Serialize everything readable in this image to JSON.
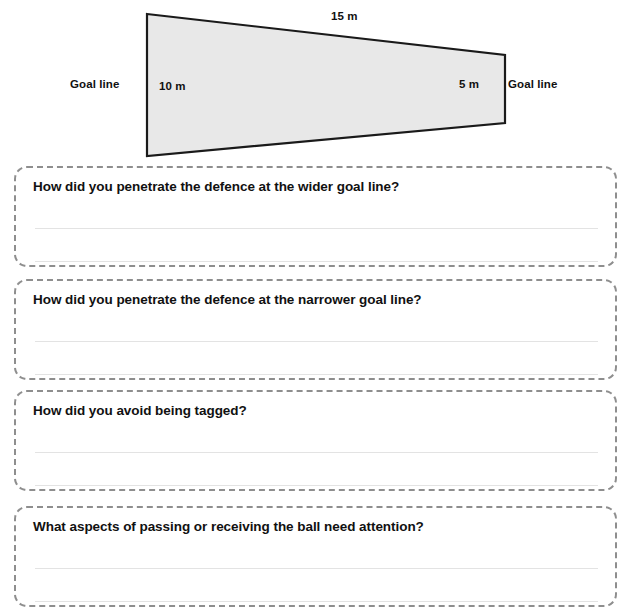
{
  "page": {
    "background_color": "#ffffff",
    "cut_off_text_top": ""
  },
  "diagram": {
    "name": "tapered-pitch-diagram",
    "shape": "trapezoid",
    "fill_color": "#e8e8e8",
    "stroke_color": "#1a1a1a",
    "labels": {
      "goal_line_left": "Goal line",
      "goal_line_right": "Goal line",
      "width_left": "10 m",
      "width_right": "5 m",
      "length_top": "15 m"
    }
  },
  "questions": [
    {
      "id": "q1",
      "text": "How did you penetrate the defence at the wider goal line?",
      "answer_lines": 2,
      "answer_values": [
        "",
        ""
      ]
    },
    {
      "id": "q2",
      "text": "How did you penetrate the defence at the narrower goal line?",
      "answer_lines": 2,
      "answer_values": [
        "",
        ""
      ]
    },
    {
      "id": "q3",
      "text": "How did you avoid being tagged?",
      "answer_lines": 2,
      "answer_values": [
        "",
        ""
      ]
    },
    {
      "id": "q4",
      "text": "What aspects of passing or receiving the ball need attention?",
      "answer_lines": 2,
      "answer_values": [
        "",
        ""
      ]
    }
  ]
}
